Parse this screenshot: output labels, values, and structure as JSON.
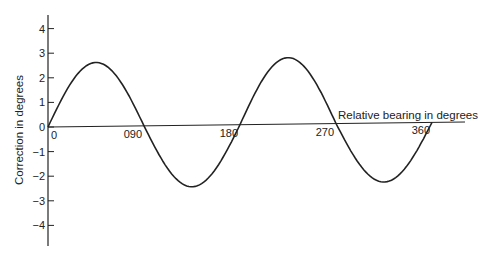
{
  "chart_data": {
    "type": "line",
    "title": "",
    "xlabel": "Relative bearing in degrees",
    "ylabel": "Correction in degrees",
    "x_tick_labels": [
      "0",
      "090",
      "180",
      "270",
      "360"
    ],
    "x_ticks": [
      0,
      90,
      180,
      270,
      360
    ],
    "y_tick_labels": [
      "4",
      "3",
      "2",
      "1",
      "0",
      "-1",
      "-2",
      "-3",
      "-4"
    ],
    "y_ticks": [
      4,
      3,
      2,
      1,
      0,
      -1,
      -2,
      -3,
      -4
    ],
    "xlim": [
      0,
      380
    ],
    "ylim": [
      -4.8,
      4.6
    ],
    "grid": false,
    "legend": null,
    "series": [
      {
        "name": "Correction (quadrantal error)",
        "x": [
          0,
          22.5,
          45,
          67.5,
          90,
          112.5,
          135,
          157.5,
          180,
          202.5,
          225,
          247.5,
          270,
          292.5,
          315,
          337.5,
          360
        ],
        "values": [
          0,
          1.8,
          2.6,
          1.8,
          0,
          -1.75,
          -2.5,
          -1.75,
          0,
          1.9,
          2.7,
          1.9,
          0,
          -1.7,
          -2.4,
          -1.7,
          0
        ]
      }
    ]
  }
}
